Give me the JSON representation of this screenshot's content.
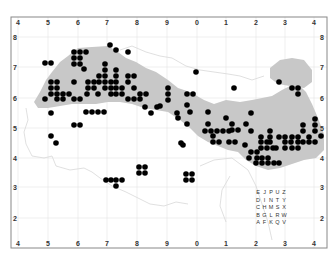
{
  "map": {
    "frame": {
      "x": 11,
      "y": 17,
      "width": 316,
      "height": 231
    },
    "colors": {
      "land": "#c8c8c8",
      "dot": "#000000",
      "frame": "#888888",
      "grid": "#e4e4e4"
    },
    "x_ticks": [
      {
        "label": "4",
        "x": 18
      },
      {
        "label": "5",
        "x": 48
      },
      {
        "label": "6",
        "x": 78
      },
      {
        "label": "7",
        "x": 107
      },
      {
        "label": "8",
        "x": 137
      },
      {
        "label": "9",
        "x": 167
      },
      {
        "label": "0",
        "x": 197
      },
      {
        "label": "1",
        "x": 226
      },
      {
        "label": "2",
        "x": 256
      },
      {
        "label": "3",
        "x": 285
      },
      {
        "label": "4",
        "x": 314
      }
    ],
    "y_ticks": [
      {
        "label": "8",
        "y": 37
      },
      {
        "label": "7",
        "y": 67
      },
      {
        "label": "6",
        "y": 98
      },
      {
        "label": "5",
        "y": 128
      },
      {
        "label": "4",
        "y": 158
      },
      {
        "label": "3",
        "y": 187
      },
      {
        "label": "2",
        "y": 218
      }
    ],
    "letter_grid": {
      "rows": [
        [
          "E",
          "J",
          "P",
          "U",
          "Z"
        ],
        [
          "D",
          "I",
          "N",
          "T",
          "Y"
        ],
        [
          "C",
          "H",
          "M",
          "S",
          "X"
        ],
        [
          "B",
          "G",
          "L",
          "R",
          "W"
        ],
        [
          "A",
          "F",
          "K",
          "Q",
          "V"
        ]
      ],
      "x0": 258,
      "y0": 194,
      "dx": 6.5,
      "dy": 7.5
    },
    "dots": [
      [
        110,
        45
      ],
      [
        116,
        50
      ],
      [
        128,
        52
      ],
      [
        74,
        52
      ],
      [
        80,
        52
      ],
      [
        86,
        52
      ],
      [
        74,
        58
      ],
      [
        80,
        58
      ],
      [
        74,
        64
      ],
      [
        80,
        64
      ],
      [
        45,
        63
      ],
      [
        51,
        63
      ],
      [
        84,
        69
      ],
      [
        74,
        82
      ],
      [
        105,
        64
      ],
      [
        105,
        70
      ],
      [
        116,
        70
      ],
      [
        99,
        76
      ],
      [
        105,
        76
      ],
      [
        116,
        76
      ],
      [
        128,
        76
      ],
      [
        134,
        76
      ],
      [
        99,
        82
      ],
      [
        105,
        82
      ],
      [
        111,
        82
      ],
      [
        116,
        82
      ],
      [
        128,
        82
      ],
      [
        51,
        82
      ],
      [
        57,
        82
      ],
      [
        51,
        88
      ],
      [
        57,
        88
      ],
      [
        88,
        82
      ],
      [
        94,
        82
      ],
      [
        51,
        94
      ],
      [
        57,
        94
      ],
      [
        63,
        94
      ],
      [
        69,
        94
      ],
      [
        87,
        94
      ],
      [
        98,
        94
      ],
      [
        111,
        94
      ],
      [
        116,
        94
      ],
      [
        122,
        94
      ],
      [
        45,
        99
      ],
      [
        57,
        99
      ],
      [
        63,
        99
      ],
      [
        74,
        99
      ],
      [
        80,
        99
      ],
      [
        128,
        99
      ],
      [
        134,
        99
      ],
      [
        140,
        99
      ],
      [
        88,
        88
      ],
      [
        94,
        88
      ],
      [
        105,
        88
      ],
      [
        111,
        88
      ],
      [
        116,
        88
      ],
      [
        122,
        88
      ],
      [
        134,
        88
      ],
      [
        140,
        94
      ],
      [
        146,
        94
      ],
      [
        145,
        107
      ],
      [
        157,
        107
      ],
      [
        151,
        113
      ],
      [
        168,
        88
      ],
      [
        168,
        94
      ],
      [
        168,
        100
      ],
      [
        187,
        94
      ],
      [
        187,
        105
      ],
      [
        193,
        94
      ],
      [
        196,
        72
      ],
      [
        234,
        88
      ],
      [
        279,
        82
      ],
      [
        292,
        88
      ],
      [
        298,
        88
      ],
      [
        298,
        94
      ],
      [
        160,
        106
      ],
      [
        177,
        113
      ],
      [
        86,
        112
      ],
      [
        92,
        112
      ],
      [
        98,
        112
      ],
      [
        104,
        112
      ],
      [
        51,
        113
      ],
      [
        51,
        136
      ],
      [
        74,
        125
      ],
      [
        80,
        125
      ],
      [
        190,
        112
      ],
      [
        208,
        112
      ],
      [
        208,
        124
      ],
      [
        213,
        136
      ],
      [
        187,
        124
      ],
      [
        178,
        118
      ],
      [
        226,
        118
      ],
      [
        232,
        124
      ],
      [
        232,
        130
      ],
      [
        238,
        130
      ],
      [
        246,
        124
      ],
      [
        205,
        131
      ],
      [
        211,
        131
      ],
      [
        217,
        131
      ],
      [
        223,
        131
      ],
      [
        229,
        131
      ],
      [
        213,
        142
      ],
      [
        219,
        142
      ],
      [
        229,
        142
      ],
      [
        235,
        142
      ],
      [
        245,
        145
      ],
      [
        251,
        152
      ],
      [
        257,
        152
      ],
      [
        262,
        158
      ],
      [
        251,
        131
      ],
      [
        251,
        113
      ],
      [
        257,
        158
      ],
      [
        268,
        158
      ],
      [
        261,
        137
      ],
      [
        267,
        142
      ],
      [
        261,
        142
      ],
      [
        267,
        148
      ],
      [
        261,
        148
      ],
      [
        273,
        148
      ],
      [
        270,
        131
      ],
      [
        270,
        137
      ],
      [
        270,
        142
      ],
      [
        276,
        148
      ],
      [
        285,
        148
      ],
      [
        292,
        148
      ],
      [
        298,
        148
      ],
      [
        279,
        137
      ],
      [
        285,
        137
      ],
      [
        292,
        137
      ],
      [
        298,
        137
      ],
      [
        285,
        142
      ],
      [
        291,
        142
      ],
      [
        298,
        142
      ],
      [
        303,
        142
      ],
      [
        309,
        142
      ],
      [
        315,
        142
      ],
      [
        262,
        163
      ],
      [
        268,
        163
      ],
      [
        274,
        163
      ],
      [
        279,
        163
      ],
      [
        303,
        131
      ],
      [
        309,
        137
      ],
      [
        315,
        131
      ],
      [
        321,
        136
      ],
      [
        315,
        125
      ],
      [
        315,
        119
      ],
      [
        303,
        125
      ],
      [
        249,
        158
      ],
      [
        256,
        163
      ],
      [
        183,
        145
      ],
      [
        106,
        180
      ],
      [
        116,
        180
      ],
      [
        122,
        180
      ],
      [
        116,
        186
      ],
      [
        111,
        180
      ],
      [
        139,
        167
      ],
      [
        145,
        167
      ],
      [
        139,
        173
      ],
      [
        145,
        173
      ],
      [
        186,
        174
      ],
      [
        192,
        174
      ],
      [
        186,
        180
      ],
      [
        192,
        180
      ],
      [
        181,
        143
      ],
      [
        56,
        143
      ]
    ]
  }
}
